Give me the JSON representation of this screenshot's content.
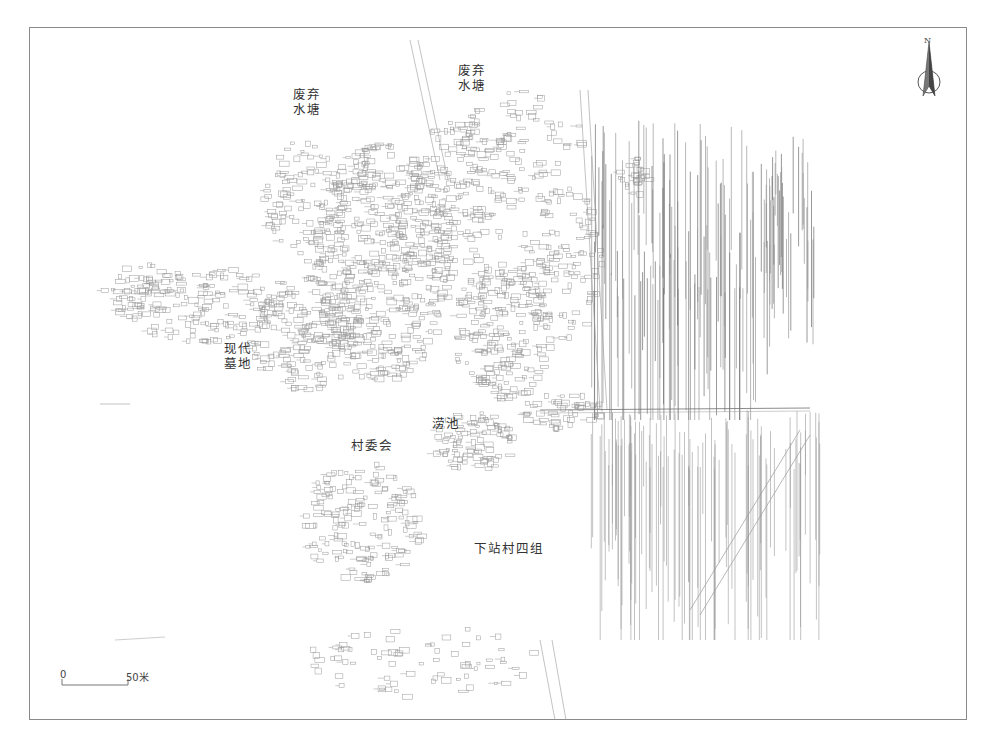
{
  "map": {
    "frame_color": "#8a8a8a",
    "line_color": "#9a9a9a",
    "dark_line_color": "#6e6e6e",
    "labels": [
      {
        "id": "abandoned-pond-west",
        "text": "废弃\n水塘",
        "x": 293,
        "y": 87
      },
      {
        "id": "abandoned-pond-north",
        "text": "废弃\n水塘",
        "x": 458,
        "y": 63
      },
      {
        "id": "modern-cemetery",
        "text": "现代\n墓地",
        "x": 224,
        "y": 341
      },
      {
        "id": "laochi",
        "text": "涝池",
        "x": 432,
        "y": 416
      },
      {
        "id": "village-committee",
        "text": "村委会",
        "x": 351,
        "y": 438
      },
      {
        "id": "xiazhan-group-4",
        "text": "下站村四组",
        "x": 474,
        "y": 541
      }
    ],
    "north_arrow": {
      "letter": "N",
      "icon": "north-arrow-icon"
    },
    "scale_bar": {
      "start_label": "0",
      "end_label": "50米"
    }
  }
}
